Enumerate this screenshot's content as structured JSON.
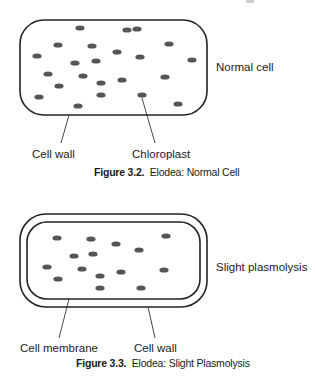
{
  "page": {
    "header_fragment": "..."
  },
  "figures": [
    {
      "id": "3.2",
      "caption_number": "Figure 3.2.",
      "caption_text": "Elodea: Normal Cell",
      "state_label": "Normal cell",
      "callouts": [
        {
          "label": "Cell wall",
          "target": "cell wall"
        },
        {
          "label": "Chloroplast",
          "target": "chloroplast"
        }
      ],
      "cell": {
        "wall": {
          "x": 20,
          "y": 20,
          "w": 187,
          "h": 95,
          "r": 24
        },
        "chloroplasts": [
          [
            80,
            28
          ],
          [
            127,
            30
          ],
          [
            137,
            29
          ],
          [
            58,
            45
          ],
          [
            92,
            46
          ],
          [
            169,
            44
          ],
          [
            37,
            56
          ],
          [
            117,
            52
          ],
          [
            140,
            57
          ],
          [
            75,
            63
          ],
          [
            96,
            61
          ],
          [
            192,
            60
          ],
          [
            48,
            74
          ],
          [
            83,
            76
          ],
          [
            122,
            80
          ],
          [
            165,
            77
          ],
          [
            59,
            86
          ],
          [
            101,
            83
          ],
          [
            39,
            97
          ],
          [
            101,
            95
          ],
          [
            142,
            95
          ],
          [
            178,
            104
          ],
          [
            78,
            106
          ]
        ]
      },
      "colors": {
        "stroke": "#222222",
        "chloroplast": "#555555"
      }
    },
    {
      "id": "3.3",
      "caption_number": "Figure 3.3.",
      "caption_text": "Elodea: Slight Plasmolysis",
      "state_label": "Slight plasmolysis",
      "callouts": [
        {
          "label": "Cell membrane",
          "target": "cell membrane"
        },
        {
          "label": "Cell wall",
          "target": "cell wall"
        }
      ],
      "cell": {
        "wall": {
          "x": 20,
          "y": 14,
          "w": 187,
          "h": 93,
          "r": 26
        },
        "membrane": {
          "x": 27,
          "y": 22,
          "w": 173,
          "h": 77,
          "r": 20
        },
        "chloroplasts": [
          [
            57,
            38
          ],
          [
            91,
            39
          ],
          [
            116,
            44
          ],
          [
            166,
            36
          ],
          [
            74,
            56
          ],
          [
            93,
            54
          ],
          [
            139,
            50
          ],
          [
            47,
            67
          ],
          [
            82,
            69
          ],
          [
            100,
            76
          ],
          [
            121,
            72
          ],
          [
            164,
            70
          ],
          [
            58,
            79
          ],
          [
            100,
            88
          ],
          [
            141,
            88
          ]
        ]
      },
      "colors": {
        "stroke": "#222222",
        "chloroplast": "#555555"
      }
    }
  ]
}
